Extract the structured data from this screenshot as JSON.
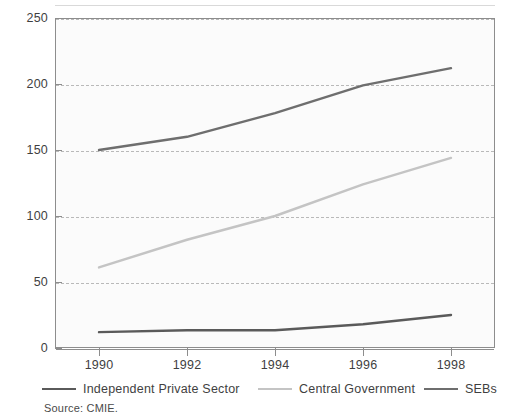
{
  "chart_data": {
    "type": "line",
    "title": "",
    "xlabel": "",
    "ylabel": "",
    "x": [
      1990,
      1992,
      1994,
      1996,
      1998
    ],
    "categories": [
      "1990",
      "1992",
      "1994",
      "1996",
      "1998"
    ],
    "xlim": [
      1989,
      1999
    ],
    "ylim": [
      0,
      250
    ],
    "yticks": [
      0,
      50,
      100,
      150,
      200,
      250
    ],
    "ytick_labels": [
      "0",
      "50",
      "100",
      "150",
      "200",
      "250"
    ],
    "grid": "horizontal-dashed",
    "legend_position": "below-axis",
    "series": [
      {
        "name": "Independent Private Sector",
        "color": "#5a5a5a",
        "values": [
          12,
          13.5,
          13.5,
          18,
          25
        ]
      },
      {
        "name": "Central Government",
        "color": "#c4c4c4",
        "values": [
          61,
          82,
          100,
          124,
          144
        ]
      },
      {
        "name": "SEBs",
        "color": "#6e6e6e",
        "values": [
          150,
          160,
          178,
          199,
          212
        ]
      }
    ]
  },
  "axes": {
    "y_ticks": [
      {
        "label": "250",
        "value": 250
      },
      {
        "label": "200",
        "value": 200
      },
      {
        "label": "150",
        "value": 150
      },
      {
        "label": "100",
        "value": 100
      },
      {
        "label": "50",
        "value": 50
      },
      {
        "label": "0",
        "value": 0
      }
    ],
    "x_ticks": [
      {
        "label": "1990",
        "value": 1990
      },
      {
        "label": "1992",
        "value": 1992
      },
      {
        "label": "1994",
        "value": 1994
      },
      {
        "label": "1996",
        "value": 1996
      },
      {
        "label": "1998",
        "value": 1998
      }
    ]
  },
  "legend": {
    "items": [
      {
        "label": "Independent Private Sector",
        "color": "#5a5a5a"
      },
      {
        "label": "Central Government",
        "color": "#c4c4c4"
      },
      {
        "label": "SEBs",
        "color": "#6e6e6e"
      }
    ]
  },
  "footer": {
    "source": "Source: CMIE."
  },
  "colors": {
    "plot_background": "#fbfbfb",
    "frame": "#8d8d8d",
    "gridline": "#b9b9b9",
    "text": "#3f3f3f"
  }
}
